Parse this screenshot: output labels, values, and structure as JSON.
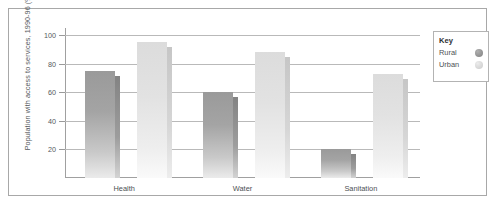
{
  "chart_data": {
    "type": "bar",
    "title": "",
    "xlabel": "",
    "ylabel": "Population with access to services, 1990-96 (%)",
    "categories": [
      "Health",
      "Water",
      "Sanitation"
    ],
    "series": [
      {
        "name": "Rural",
        "values": [
          75,
          60,
          20
        ],
        "color": "#9a9a9a"
      },
      {
        "name": "Urban",
        "values": [
          95,
          88,
          73
        ],
        "color": "#dcdcdc"
      }
    ],
    "ylim": [
      0,
      105
    ],
    "yticks": [
      20,
      40,
      60,
      80,
      100
    ],
    "ytick_labels": [
      "20",
      "40",
      "60",
      "80",
      "100"
    ],
    "grid": true,
    "legend_position": "right-outside"
  },
  "legend": {
    "title": "Key",
    "entries": [
      {
        "label": "Rural",
        "marker": "circle-dark"
      },
      {
        "label": "Urban",
        "marker": "circle-light"
      }
    ]
  }
}
